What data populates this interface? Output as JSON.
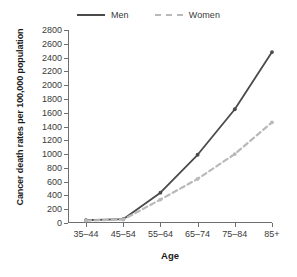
{
  "chart_data": {
    "type": "line",
    "title": "",
    "xlabel": "Age",
    "ylabel": "Cancer death rates per 100,000 population",
    "categories": [
      "35–44",
      "45–54",
      "55–64",
      "65–74",
      "75–84",
      "85+"
    ],
    "ylim": [
      0,
      2800
    ],
    "ytick_values": [
      0,
      200,
      400,
      600,
      800,
      1000,
      1200,
      1400,
      1600,
      1800,
      2000,
      2200,
      2400,
      2600,
      2800
    ],
    "ytick_labels": [
      "0",
      "200",
      "400",
      "600",
      "800",
      "1000",
      "1200",
      "1400",
      "1600",
      "1800",
      "2000",
      "2200",
      "2400",
      "2600",
      "2800"
    ],
    "grid": false,
    "legend_position": "top-center",
    "series": [
      {
        "name": "Men",
        "color": "#4a4a4a",
        "style": "solid",
        "values": [
          40,
          55,
          440,
          990,
          1650,
          2480
        ]
      },
      {
        "name": "Women",
        "color": "#b9b9b9",
        "style": "dashed",
        "values": [
          35,
          50,
          340,
          640,
          1000,
          1460
        ]
      }
    ]
  },
  "legend": {
    "men_label": "Men",
    "women_label": "Women"
  },
  "axes": {
    "x_title": "Age",
    "y_title": "Cancer death rates per 100,000 population"
  }
}
